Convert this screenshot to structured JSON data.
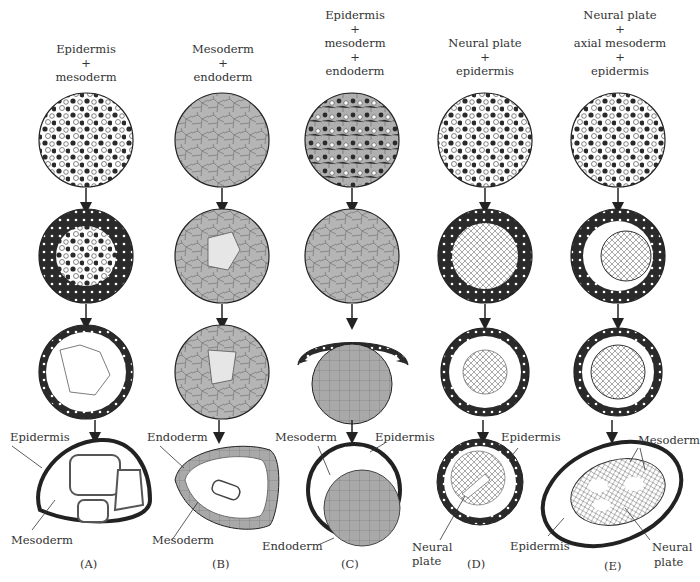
{
  "figure": {
    "columns": [
      {
        "id": "A",
        "panel_label": "(A)",
        "title_lines": [
          "Epidermis",
          "+",
          "mesoderm"
        ],
        "labels": [
          "Epidermis",
          "Mesoderm"
        ]
      },
      {
        "id": "B",
        "panel_label": "(B)",
        "title_lines": [
          "Mesoderm",
          "+",
          "endoderm"
        ],
        "labels": [
          "Endoderm",
          "Mesoderm"
        ]
      },
      {
        "id": "C",
        "panel_label": "(C)",
        "title_lines": [
          "Epidermis",
          "+",
          "mesoderm",
          "+",
          "endoderm"
        ],
        "labels": [
          "Mesoderm",
          "Epidermis",
          "Endoderm"
        ]
      },
      {
        "id": "D",
        "panel_label": "(D)",
        "title_lines": [
          "Neural plate",
          "+",
          "epidermis"
        ],
        "labels": [
          "Epidermis",
          "Neural",
          "plate"
        ]
      },
      {
        "id": "E",
        "panel_label": "(E)",
        "title_lines": [
          "Neural plate",
          "+",
          "axial mesoderm",
          "+",
          "epidermis"
        ],
        "labels": [
          "Mesoderm",
          "Epidermis",
          "Neural",
          "plate"
        ]
      }
    ],
    "colors": {
      "line": "#222222",
      "endoderm_fill": "#a9a9a9",
      "mesoderm_fill": "#d6d6d6",
      "epidermis_dark": "#2a2a2a",
      "background": "#ffffff"
    }
  }
}
